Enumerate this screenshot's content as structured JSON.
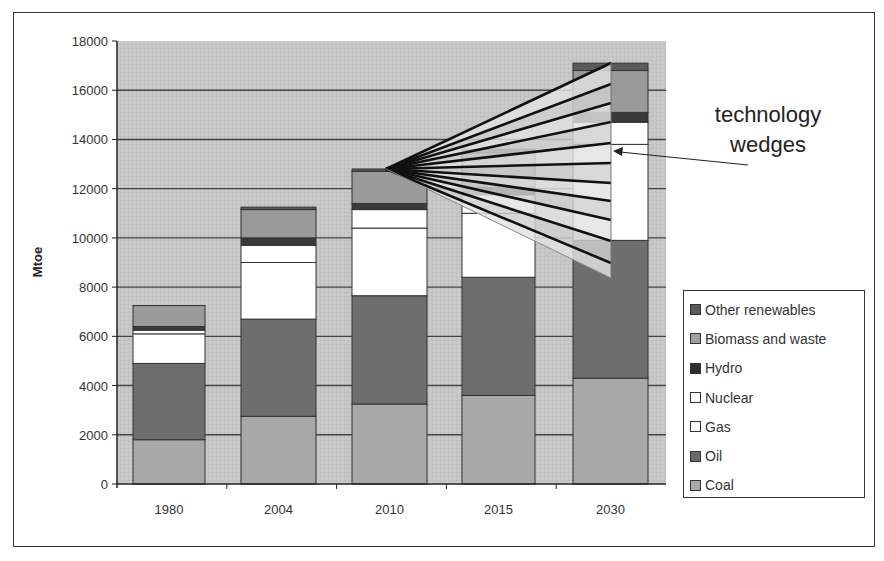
{
  "chart_data": {
    "type": "bar",
    "stacked": true,
    "title": "",
    "xlabel": "",
    "ylabel": "Mtoe",
    "ylim": [
      0,
      18000
    ],
    "yticks": [
      0,
      2000,
      4000,
      6000,
      8000,
      10000,
      12000,
      14000,
      16000,
      18000
    ],
    "grid": true,
    "legend_position": "right",
    "categories": [
      "1980",
      "2004",
      "2010",
      "2015",
      "2030"
    ],
    "series": [
      {
        "name": "Coal",
        "color": "#a8a8a8",
        "values": [
          1800,
          2750,
          3250,
          3600,
          4300
        ]
      },
      {
        "name": "Oil",
        "color": "#6e6e6e",
        "values": [
          3100,
          3950,
          4400,
          4800,
          5600
        ]
      },
      {
        "name": "Gas",
        "color": "#ffffff",
        "values": [
          1200,
          2300,
          2750,
          2600,
          3900
        ]
      },
      {
        "name": "Nuclear",
        "color": "#ffffff",
        "values": [
          150,
          700,
          750,
          750,
          900
        ]
      },
      {
        "name": "Hydro",
        "color": "#3a3a3a",
        "values": [
          150,
          300,
          250,
          300,
          400
        ]
      },
      {
        "name": "Biomass and waste",
        "color": "#9a9a9a",
        "values": [
          850,
          1150,
          1300,
          1400,
          1700
        ]
      },
      {
        "name": "Other renewables",
        "color": "#5a5a5a",
        "values": [
          0,
          100,
          100,
          150,
          300
        ]
      }
    ],
    "annotations": [
      {
        "text": "technology wedges",
        "type": "fan-of-wedges",
        "origin": {
          "category": "2010",
          "value": 12800
        },
        "span_at_2030": [
          8300,
          17100
        ],
        "wedge_count": 11
      }
    ]
  },
  "axis": {
    "ylabel": "Mtoe",
    "yticks": [
      "0",
      "2000",
      "4000",
      "6000",
      "8000",
      "10000",
      "12000",
      "14000",
      "16000",
      "18000"
    ],
    "xticks": [
      "1980",
      "2004",
      "2010",
      "2015",
      "2030"
    ]
  },
  "legend": {
    "items": [
      {
        "label": "Other renewables",
        "color": "#5a5a5a"
      },
      {
        "label": "Biomass and waste",
        "color": "#a0a0a0"
      },
      {
        "label": "Hydro",
        "color": "#2e2e2e"
      },
      {
        "label": "Nuclear",
        "color": "#ffffff"
      },
      {
        "label": "Gas",
        "color": "#ffffff"
      },
      {
        "label": "Oil",
        "color": "#6a6a6a"
      },
      {
        "label": "Coal",
        "color": "#a8a8a8"
      }
    ]
  },
  "annotation": {
    "line1": "technology",
    "line2": "wedges"
  },
  "colors": {
    "plot_bg": "#c4c4c4",
    "gridline": "#444444",
    "wedge_fill": "#d8d8d8",
    "wedge_line": "#111111"
  }
}
